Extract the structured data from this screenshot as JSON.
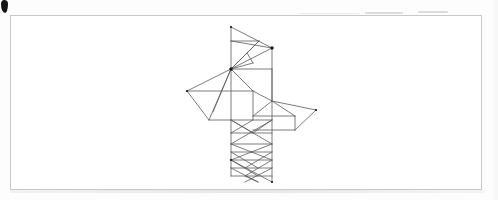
{
  "page": {
    "background_color": "#fdfdfd",
    "width": 498,
    "height": 200
  },
  "frame": {
    "name": "figure-border",
    "border_color": "#c9c9c9",
    "fill_color": "#ffffff",
    "x": 10,
    "y": 15,
    "width": 472,
    "height": 175
  },
  "artifacts": {
    "ink_blot": {
      "label": "ink-blot",
      "color": "#141414",
      "x": 1,
      "y": 0
    },
    "scan_streaks": [
      {
        "label": "scan-streak",
        "color": "#d6d6d6",
        "x": 365,
        "y": 12,
        "width": 38
      },
      {
        "label": "scan-streak",
        "color": "#d6d6d6",
        "x": 418,
        "y": 11,
        "width": 30
      },
      {
        "label": "scan-streak",
        "color": "#e6e6e6",
        "x": 300,
        "y": 13,
        "width": 60
      }
    ]
  },
  "drawing": {
    "name": "isometric-wireframe",
    "stroke_color": "#5a5a5a",
    "stroke_width": 0.8,
    "node_color": "#1a1a1a",
    "description": "Vertical rectangular panel crossed by a horizontal parallelogram plane, with triangulated upper cell and diamond lattice lower cells.",
    "nodes": [
      {
        "label": "top-apex",
        "x": 231,
        "y": 27
      },
      {
        "label": "upper-right",
        "x": 272,
        "y": 48
      },
      {
        "label": "hub",
        "x": 231,
        "y": 69
      },
      {
        "label": "left-wing-tip",
        "x": 187,
        "y": 91
      },
      {
        "label": "right-wing-tip",
        "x": 316,
        "y": 110
      },
      {
        "label": "bottom-left",
        "x": 231,
        "y": 160
      },
      {
        "label": "bottom-right",
        "x": 272,
        "y": 182
      }
    ],
    "segments": [
      [
        231,
        27,
        231,
        160
      ],
      [
        272,
        48,
        272,
        182
      ],
      [
        231,
        27,
        272,
        48
      ],
      [
        231,
        160,
        272,
        182
      ],
      [
        231,
        41,
        259,
        41
      ],
      [
        231,
        41,
        272,
        48
      ],
      [
        231,
        69,
        272,
        48
      ],
      [
        231,
        69,
        259,
        41
      ],
      [
        231,
        69,
        247,
        53
      ],
      [
        247,
        53,
        259,
        41
      ],
      [
        247,
        53,
        253,
        63
      ],
      [
        253,
        63,
        231,
        69
      ],
      [
        231,
        69,
        272,
        69
      ],
      [
        231,
        69,
        187,
        91
      ],
      [
        231,
        69,
        213,
        112
      ],
      [
        231,
        69,
        209,
        120
      ],
      [
        187,
        91,
        209,
        120
      ],
      [
        209,
        120,
        231,
        120
      ],
      [
        187,
        91,
        253,
        91
      ],
      [
        253,
        91,
        272,
        101
      ],
      [
        253,
        91,
        253,
        120
      ],
      [
        231,
        69,
        253,
        91
      ],
      [
        272,
        69,
        272,
        101
      ],
      [
        231,
        120,
        272,
        120
      ],
      [
        231,
        120,
        253,
        133
      ],
      [
        272,
        101,
        316,
        110
      ],
      [
        316,
        110,
        295,
        130
      ],
      [
        295,
        130,
        253,
        130
      ],
      [
        272,
        101,
        295,
        116
      ],
      [
        295,
        116,
        253,
        116
      ],
      [
        253,
        116,
        272,
        101
      ],
      [
        295,
        116,
        295,
        130
      ],
      [
        231,
        120,
        272,
        144
      ],
      [
        231,
        144,
        272,
        120
      ],
      [
        231,
        144,
        272,
        144
      ],
      [
        231,
        144,
        272,
        160
      ],
      [
        231,
        160,
        272,
        144
      ],
      [
        231,
        152,
        272,
        152
      ],
      [
        231,
        152,
        258,
        168
      ],
      [
        245,
        168,
        272,
        152
      ],
      [
        231,
        160,
        272,
        160
      ],
      [
        231,
        160,
        258,
        176
      ],
      [
        245,
        176,
        272,
        160
      ],
      [
        231,
        168,
        272,
        168
      ],
      [
        231,
        168,
        258,
        182
      ],
      [
        245,
        182,
        272,
        168
      ],
      [
        231,
        176,
        272,
        176
      ],
      [
        245,
        176,
        258,
        182
      ],
      [
        231,
        160,
        231,
        176
      ],
      [
        253,
        133,
        272,
        120
      ],
      [
        231,
        133,
        272,
        133
      ],
      [
        231,
        133,
        253,
        120
      ]
    ]
  }
}
